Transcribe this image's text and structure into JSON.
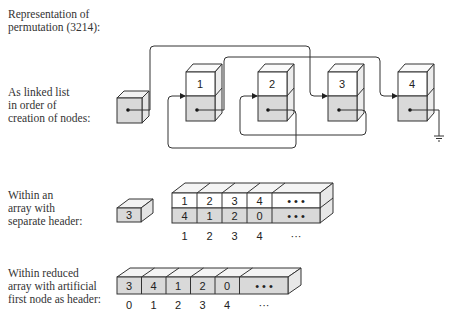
{
  "title": "Representation of\npermutation (3214):",
  "sections": {
    "linked_list": {
      "label": "As linked list\nin order of\ncreation of nodes:",
      "node_labels": [
        "1",
        "2",
        "3",
        "4"
      ]
    },
    "array_separate": {
      "label": "Within an\narray with\nseparate header:",
      "header_value": "3",
      "row_values": [
        "1",
        "2",
        "3",
        "4",
        "• • •"
      ],
      "row_links": [
        "4",
        "1",
        "2",
        "0",
        "• • •"
      ],
      "indices": [
        "1",
        "2",
        "3",
        "4",
        "···"
      ]
    },
    "array_reduced": {
      "label": "Within reduced\narray with artificial\nfirst node as header:",
      "values": [
        "3",
        "4",
        "1",
        "2",
        "0",
        "• • •"
      ],
      "indices": [
        "0",
        "1",
        "2",
        "3",
        "4",
        "···"
      ]
    }
  },
  "colors": {
    "fill_gray": "#d9d9d9",
    "fill_white": "#ffffff",
    "stroke": "#333333"
  }
}
